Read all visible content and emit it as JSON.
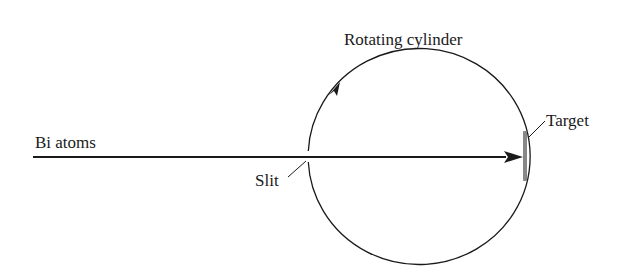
{
  "diagram": {
    "labels": {
      "cylinder": "Rotating cylinder",
      "beam": "Bi atoms",
      "slit": "Slit",
      "target": "Target"
    },
    "colors": {
      "line": "#1a1a1a",
      "target": "#888888",
      "background": "#ffffff"
    }
  }
}
